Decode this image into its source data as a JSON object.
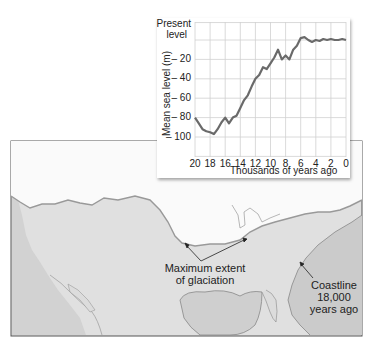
{
  "chart_data": {
    "type": "line",
    "title": "",
    "xlabel": "Thousands of years ago",
    "ylabel": "Mean sea level (m)",
    "x_ticks": [
      20,
      18,
      16,
      14,
      12,
      10,
      8,
      6,
      4,
      2,
      0
    ],
    "y_ticks": [
      "Present level",
      "-20",
      "-40",
      "-60",
      "-80",
      "-100"
    ],
    "y_tick_values": [
      0,
      -20,
      -40,
      -60,
      -80,
      -100
    ],
    "xlim": [
      20,
      0
    ],
    "ylim": [
      -120,
      18
    ],
    "grid": true,
    "legend": null,
    "series": [
      {
        "name": "Mean sea level",
        "x": [
          20,
          19.5,
          19,
          18.5,
          18,
          17.5,
          17,
          16.5,
          16,
          15.5,
          15,
          14.5,
          14,
          13.5,
          13,
          12.5,
          12,
          11.5,
          11,
          10.5,
          10,
          9.5,
          9,
          8.5,
          8,
          7.5,
          7,
          6.5,
          6,
          5.5,
          5,
          4.5,
          4,
          3.5,
          3,
          2.5,
          2,
          1.5,
          1,
          0.5,
          0
        ],
        "values": [
          -80,
          -86,
          -92,
          -94,
          -95,
          -97,
          -92,
          -85,
          -80,
          -86,
          -80,
          -78,
          -70,
          -62,
          -57,
          -48,
          -40,
          -36,
          -28,
          -30,
          -24,
          -18,
          -10,
          -20,
          -16,
          -20,
          -10,
          -6,
          2,
          3,
          0,
          -2,
          0,
          -1,
          1,
          0,
          1,
          0,
          0,
          1,
          0
        ]
      }
    ]
  },
  "chart": {
    "ylabels": {
      "present_line1": "Present",
      "present_line2": "level",
      "m20": "– 20",
      "m40": "– 40",
      "m60": "– 60",
      "m80": "– 80",
      "m100": "– 100"
    },
    "xlabels": [
      "20",
      "18",
      "16",
      "14",
      "12",
      "10",
      "8",
      "6",
      "4",
      "2",
      "0"
    ],
    "ytitle": "Mean sea level (m)",
    "xtitle": "Thousands of years ago"
  },
  "map": {
    "glaciation_label_line1": "Maximum extent",
    "glaciation_label_line2": "of glaciation",
    "coastline_label_line1": "Coastline",
    "coastline_label_line2": "18,000",
    "coastline_label_line3": "years ago",
    "colors": {
      "ice": "#ffffff",
      "land": "#e2e2e2",
      "ocean": "#cfcfcf",
      "border": "#555555",
      "curve": "#666666"
    }
  }
}
